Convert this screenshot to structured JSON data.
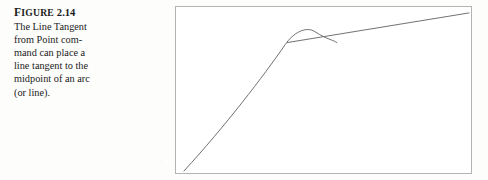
{
  "page": {
    "background_color": "#fdfdfc",
    "text_color": "#1b1b1b"
  },
  "caption": {
    "figure_word": "Figure",
    "figure_number": "2.14",
    "lines": [
      "The Line Tangent",
      "from Point com-",
      "mand can place a",
      "line tangent to the",
      "midpoint of an arc",
      "(or line)."
    ]
  },
  "figure": {
    "border_color": "#b3b3b3",
    "background_color": "#ffffff",
    "stroke_color": "#6f6f73"
  },
  "chart_data": {
    "type": "line",
    "xlabel": "",
    "ylabel": "",
    "grid": false,
    "legend": null,
    "axis_visible": false,
    "xlim": [
      0,
      297
    ],
    "ylim": [
      0,
      168
    ],
    "y_axis_inverted": true,
    "series": [
      {
        "name": "arc",
        "type": "arc",
        "description": "Arc rising from lower-left, curving over an apex and descending in a short tail to the right.",
        "path": "M 8 166 C 50 120, 88 70, 110 38 C 118 26, 131 19, 140 25 C 152 33, 158 33, 162 36",
        "points": [
          {
            "x": 8,
            "y": 166
          },
          {
            "x": 60,
            "y": 108
          },
          {
            "x": 95,
            "y": 56
          },
          {
            "x": 112,
            "y": 33
          },
          {
            "x": 121,
            "y": 23
          },
          {
            "x": 133,
            "y": 22
          },
          {
            "x": 147,
            "y": 29
          },
          {
            "x": 162,
            "y": 36
          }
        ]
      },
      {
        "name": "tangent-line",
        "type": "line",
        "description": "Straight tangent line touching the arc at its midpoint/apex and extending to the upper-right corner.",
        "path": "M 112 36 L 295 6",
        "points": [
          {
            "x": 112,
            "y": 36
          },
          {
            "x": 295,
            "y": 6
          }
        ]
      }
    ],
    "annotations": [
      {
        "name": "tangent-point",
        "x": 121,
        "y": 23,
        "label": "midpoint of arc where line is tangent"
      }
    ]
  }
}
